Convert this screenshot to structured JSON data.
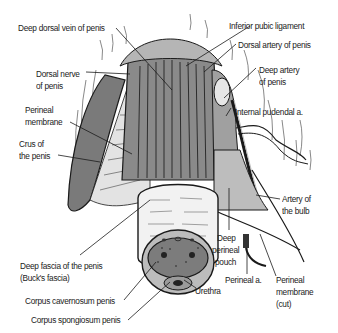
{
  "diagram": {
    "colors": {
      "background": "#ffffff",
      "tissue_dark": "#6f6f6f",
      "tissue_mid": "#9a9a9a",
      "tissue_light": "#d8d8d8",
      "outline": "#1a1a1a",
      "label_text": "#222222"
    },
    "labels": {
      "deep_dorsal_vein": "Deep dorsal vein of penis",
      "inferior_pubic_ligament": "Inferior pubic ligament",
      "dorsal_artery": "Dorsal artery of penis",
      "dorsal_nerve_l1": "Dorsal nerve",
      "dorsal_nerve_l2": "of penis",
      "deep_artery_l1": "Deep artery",
      "deep_artery_l2": "of penis",
      "internal_pudendal": "Internal pudendal a.",
      "perineal_membrane_l1": "Perineal",
      "perineal_membrane_l2": "membrane",
      "crus_l1": "Crus of",
      "crus_l2": "the penis",
      "artery_bulb_l1": "Artery of",
      "artery_bulb_l2": "the bulb",
      "deep_perineal_pouch_l1": "Deep",
      "deep_perineal_pouch_l2": "perineal",
      "deep_perineal_pouch_l3": "pouch",
      "deep_fascia_l1": "Deep fascia of the penis",
      "deep_fascia_l2": "(Buck's fascia)",
      "perineal_a": "Perineal a.",
      "perineal_membrane_cut_l1": "Perineal",
      "perineal_membrane_cut_l2": "membrane",
      "perineal_membrane_cut_l3": "(cut)",
      "urethra": "Urethra",
      "corpus_cavernosum": "Corpus cavernosum penis",
      "corpus_spongiosum": "Corpus spongiosum penis"
    }
  }
}
